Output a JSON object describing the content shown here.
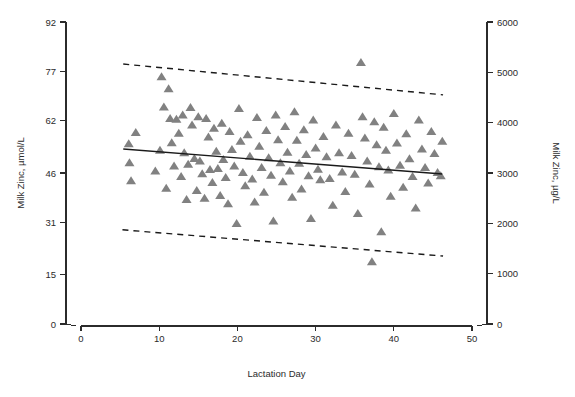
{
  "figure": {
    "width": 575,
    "height": 397,
    "background": "#ffffff",
    "marker_color": "#818181",
    "line_color": "#1a1a1a",
    "text_color": "#2b2b2b"
  },
  "axes": {
    "x_title": "Lactation Day",
    "y_left_title": "Milk Zinc, µmol/L",
    "y_right_title": "Milk Zinc, µg/L",
    "x_ticks": [
      "0",
      "10",
      "20",
      "30",
      "40",
      "50"
    ],
    "y_left_ticks": [
      "0",
      "15",
      "31",
      "46",
      "62",
      "77",
      "92"
    ],
    "y_right_ticks": [
      "0",
      "1000",
      "2000",
      "3000",
      "4000",
      "5000",
      "6000"
    ]
  },
  "chart_data": {
    "type": "scatter",
    "title": "",
    "xlabel": "Lactation Day",
    "ylabel": "Milk Zinc, µmol/L",
    "ylabel_secondary": "Milk Zinc, µg/L",
    "xlim": [
      0,
      50
    ],
    "ylim": [
      0,
      92
    ],
    "ylim_secondary": [
      0,
      6000
    ],
    "xticks": [
      0,
      10,
      20,
      30,
      40,
      50
    ],
    "yticks": [
      0,
      15,
      31,
      46,
      62,
      77,
      92
    ],
    "yticks_secondary": [
      0,
      1000,
      2000,
      3000,
      4000,
      5000,
      6000
    ],
    "grid": false,
    "legend": "none",
    "marker": "triangle-up",
    "marker_color": "#818181",
    "series": [
      {
        "name": "Milk zinc samples",
        "points": [
          [
            6.1,
            54.8
          ],
          [
            6.2,
            49.0
          ],
          [
            6.4,
            43.5
          ],
          [
            7.0,
            58.2
          ],
          [
            9.5,
            46.5
          ],
          [
            10.1,
            52.8
          ],
          [
            10.3,
            75.2
          ],
          [
            10.6,
            66.0
          ],
          [
            10.9,
            41.2
          ],
          [
            11.2,
            71.5
          ],
          [
            11.4,
            62.5
          ],
          [
            11.6,
            55.1
          ],
          [
            11.9,
            48.0
          ],
          [
            12.2,
            62.2
          ],
          [
            12.5,
            58.0
          ],
          [
            12.8,
            44.8
          ],
          [
            13.0,
            63.5
          ],
          [
            13.2,
            52.0
          ],
          [
            13.5,
            37.8
          ],
          [
            13.7,
            48.5
          ],
          [
            14.0,
            65.8
          ],
          [
            14.2,
            60.5
          ],
          [
            14.5,
            50.3
          ],
          [
            14.8,
            40.5
          ],
          [
            15.0,
            63.0
          ],
          [
            15.2,
            49.5
          ],
          [
            15.5,
            45.6
          ],
          [
            15.8,
            38.2
          ],
          [
            16.0,
            62.5
          ],
          [
            16.3,
            56.8
          ],
          [
            16.5,
            46.9
          ],
          [
            16.8,
            43.0
          ],
          [
            17.0,
            59.5
          ],
          [
            17.3,
            52.5
          ],
          [
            17.5,
            47.2
          ],
          [
            17.8,
            39.0
          ],
          [
            18.0,
            61.0
          ],
          [
            18.2,
            50.0
          ],
          [
            18.5,
            44.5
          ],
          [
            18.8,
            36.5
          ],
          [
            19.0,
            58.5
          ],
          [
            19.3,
            53.0
          ],
          [
            19.6,
            48.0
          ],
          [
            19.9,
            30.5
          ],
          [
            20.2,
            65.5
          ],
          [
            20.4,
            55.5
          ],
          [
            20.7,
            46.0
          ],
          [
            21.0,
            42.0
          ],
          [
            21.3,
            57.5
          ],
          [
            21.6,
            51.0
          ],
          [
            21.9,
            44.0
          ],
          [
            22.2,
            37.0
          ],
          [
            22.5,
            62.8
          ],
          [
            22.8,
            54.0
          ],
          [
            23.1,
            47.5
          ],
          [
            23.4,
            40.0
          ],
          [
            23.7,
            58.8
          ],
          [
            24.0,
            50.5
          ],
          [
            24.3,
            45.2
          ],
          [
            24.6,
            31.2
          ],
          [
            24.9,
            63.5
          ],
          [
            25.2,
            56.0
          ],
          [
            25.5,
            49.0
          ],
          [
            25.8,
            43.2
          ],
          [
            26.1,
            60.0
          ],
          [
            26.4,
            52.2
          ],
          [
            26.7,
            46.5
          ],
          [
            27.0,
            38.5
          ],
          [
            27.3,
            64.5
          ],
          [
            27.6,
            55.8
          ],
          [
            27.9,
            48.8
          ],
          [
            28.2,
            41.0
          ],
          [
            28.5,
            59.0
          ],
          [
            28.8,
            51.5
          ],
          [
            29.1,
            45.0
          ],
          [
            29.4,
            32.0
          ],
          [
            29.7,
            62.0
          ],
          [
            30.0,
            53.5
          ],
          [
            30.3,
            47.0
          ],
          [
            30.6,
            43.8
          ],
          [
            31.0,
            57.0
          ],
          [
            31.4,
            50.8
          ],
          [
            31.8,
            44.2
          ],
          [
            32.2,
            36.0
          ],
          [
            32.6,
            60.5
          ],
          [
            33.0,
            52.0
          ],
          [
            33.4,
            46.2
          ],
          [
            33.8,
            40.2
          ],
          [
            34.2,
            58.0
          ],
          [
            34.6,
            51.2
          ],
          [
            35.0,
            45.5
          ],
          [
            35.4,
            33.5
          ],
          [
            35.8,
            79.5
          ],
          [
            36.0,
            63.0
          ],
          [
            36.3,
            56.5
          ],
          [
            36.6,
            49.5
          ],
          [
            36.9,
            42.5
          ],
          [
            37.2,
            18.8
          ],
          [
            37.5,
            61.5
          ],
          [
            37.8,
            54.5
          ],
          [
            38.1,
            47.8
          ],
          [
            38.4,
            28.0
          ],
          [
            38.7,
            59.8
          ],
          [
            39.0,
            52.8
          ],
          [
            39.3,
            46.8
          ],
          [
            39.6,
            38.8
          ],
          [
            40.0,
            64.0
          ],
          [
            40.4,
            55.0
          ],
          [
            40.8,
            48.2
          ],
          [
            41.2,
            41.5
          ],
          [
            41.6,
            57.8
          ],
          [
            42.0,
            50.2
          ],
          [
            42.4,
            44.8
          ],
          [
            42.8,
            35.2
          ],
          [
            43.2,
            62.0
          ],
          [
            43.6,
            53.2
          ],
          [
            44.0,
            47.5
          ],
          [
            44.4,
            42.8
          ],
          [
            44.8,
            58.5
          ],
          [
            45.2,
            51.8
          ],
          [
            45.6,
            46.0
          ],
          [
            46.0,
            45.0
          ],
          [
            46.2,
            55.5
          ]
        ]
      }
    ],
    "fit_line": {
      "style": "solid",
      "label": "regression fit",
      "x": [
        5.4,
        46.2
      ],
      "y": [
        53.3,
        45.7
      ]
    },
    "reference_bands": [
      {
        "style": "dashed",
        "label": "upper reference limit",
        "x": [
          5.4,
          46.3
        ],
        "y": [
          79.2,
          69.8
        ]
      },
      {
        "style": "dashed",
        "label": "lower reference limit",
        "x": [
          5.3,
          46.3
        ],
        "y": [
          28.7,
          20.7
        ]
      }
    ]
  }
}
